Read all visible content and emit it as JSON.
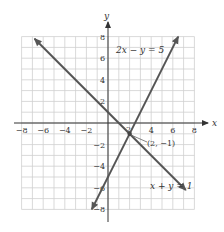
{
  "chart_data": {
    "type": "line",
    "title": "",
    "xlabel": "x",
    "ylabel": "y",
    "xlim": [
      -8,
      8
    ],
    "ylim": [
      -8,
      8
    ],
    "grid": true,
    "x_ticks": [
      -8,
      -6,
      -4,
      -2,
      4,
      6,
      8
    ],
    "y_ticks": [
      8,
      6,
      4,
      2,
      -2,
      -4,
      -6,
      -8
    ],
    "x_tick_labels": [
      "−8",
      "−6",
      "−4",
      "−2",
      "4",
      "6",
      "8"
    ],
    "y_tick_labels": [
      "8",
      "6",
      "4",
      "2",
      "−2",
      "−4",
      "−6",
      "−8"
    ],
    "series": [
      {
        "name": "2x − y = 5",
        "equation": "y = 2x - 5",
        "x": [
          -1.5,
          6.5
        ],
        "y": [
          -8,
          8
        ],
        "color": "#555555"
      },
      {
        "name": "x + y = 1",
        "equation": "y = 1 - x",
        "x": [
          -6.8,
          7.2
        ],
        "y": [
          7.8,
          -6.2
        ],
        "color": "#555555"
      }
    ],
    "annotations": [
      {
        "text": "(2, −1)",
        "x": 2,
        "y": -1,
        "type": "intersection-point"
      },
      {
        "text": "2x − y = 5",
        "x": 0.5,
        "y": 7,
        "type": "line-label"
      },
      {
        "text": "x + y = 1",
        "x": 4,
        "y": -5.5,
        "type": "line-label"
      }
    ]
  },
  "labels": {
    "x_axis": "x",
    "y_axis": "y",
    "line1": "2x − y = 5",
    "line2": "x + y = 1",
    "intersection": "(2, −1)",
    "tick_2_x": "2"
  }
}
